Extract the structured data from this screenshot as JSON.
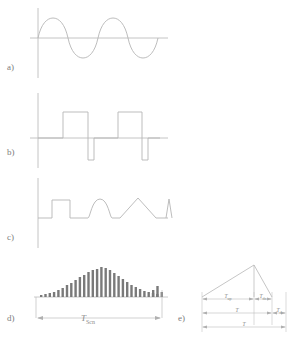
{
  "figure": {
    "stroke_color": "#b6b6b6",
    "axis_color": "#bdbdbd",
    "bar_color": "#7a7a7a",
    "text_color": "#8a8a8a",
    "background": "#ffffff"
  },
  "panels": [
    {
      "id": "a",
      "label": "a)",
      "type": "sine-wave",
      "description": "Continuous sinusoidal carrier signal on a horizontal time axis",
      "cycles": 2.5,
      "amplitude": 22,
      "baseline_y": 38
    },
    {
      "id": "b",
      "label": "b)",
      "type": "bipolar-pulse-train",
      "description": "Two wide positive rectangular pulses each followed by a narrow negative pulse",
      "pulses": [
        {
          "kind": "positive",
          "start": 63,
          "end": 88,
          "height": 26
        },
        {
          "kind": "negative",
          "start": 88,
          "end": 94,
          "height": 22
        },
        {
          "kind": "positive",
          "start": 118,
          "end": 142,
          "height": 26
        },
        {
          "kind": "negative",
          "start": 142,
          "end": 148,
          "height": 22
        }
      ],
      "baseline_y": 138
    },
    {
      "id": "c",
      "label": "c)",
      "type": "mixed-pulse-shapes",
      "description": "Rectangular pulse, half-sine bump, triangular pulse and a narrow spike",
      "shapes": [
        "rectangle",
        "half-sine",
        "triangle",
        "spike"
      ],
      "baseline_y": 218
    },
    {
      "id": "d",
      "label": "d)",
      "type": "bar-burst-envelope",
      "description": "Gaussian-enveloped bar burst followed by a short trailing bar group, with a scan-time dimension",
      "dimension": {
        "symbol": "T",
        "subscript": "Scn"
      },
      "baseline_y": 297,
      "bars": [
        2,
        3,
        4,
        5,
        7,
        9,
        12,
        14,
        17,
        20,
        22,
        25,
        27,
        28,
        30,
        29,
        27,
        24,
        21,
        18,
        15,
        12,
        10,
        8,
        6,
        5,
        4,
        3
      ],
      "trailing_bars": [
        7,
        11,
        5
      ]
    },
    {
      "id": "e",
      "label": "e)",
      "type": "sawtooth-with-dimensions",
      "description": "Asymmetric sawtooth ramp with dimension lines marking up-sweep, down-sweep, period and dead time",
      "baseline_y": 297,
      "dimensions": [
        {
          "symbol": "T",
          "subscript": "up"
        },
        {
          "symbol": "T",
          "subscript": "dn"
        },
        {
          "symbol": "T",
          "subscript": ""
        },
        {
          "symbol": "T",
          "subscript": "d"
        }
      ]
    }
  ]
}
